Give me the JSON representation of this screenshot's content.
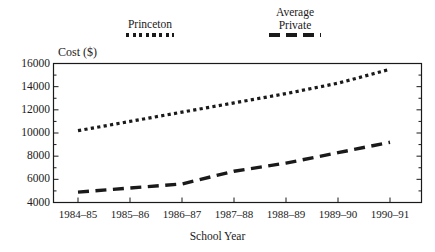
{
  "chart_data": {
    "type": "line",
    "title": "",
    "xlabel": "School Year",
    "ylabel": "Cost ($)",
    "categories": [
      "1984–85",
      "1985–86",
      "1986–87",
      "1987–88",
      "1988–89",
      "1989–90",
      "1990–91"
    ],
    "yticks": [
      4000,
      6000,
      8000,
      10000,
      12000,
      14000,
      16000
    ],
    "ytick_labels": [
      "4000",
      "6000",
      "8000",
      "10000",
      "12000",
      "14000",
      "16000"
    ],
    "ylim": [
      4000,
      16000
    ],
    "grid": false,
    "legend_position": "above-plot",
    "series": [
      {
        "name": "Princeton",
        "style": "dotted",
        "color": "#1a1a1a",
        "values": [
          10200,
          11000,
          11800,
          12600,
          13400,
          14300,
          15500
        ]
      },
      {
        "name": "Average Private",
        "style": "dashed",
        "color": "#1a1a1a",
        "values": [
          4900,
          5250,
          5600,
          6700,
          7400,
          8300,
          9200
        ]
      }
    ]
  },
  "legend": {
    "princeton": {
      "label": "Princeton",
      "swatch": "dotted-line-swatch"
    },
    "private": {
      "label_line1": "Average",
      "label_line2": "Private",
      "swatch": "dashed-line-swatch"
    }
  },
  "axes": {
    "ylabel": "Cost ($)",
    "xlabel": "School Year"
  }
}
